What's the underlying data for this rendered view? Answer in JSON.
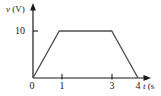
{
  "chart_data": {
    "type": "line",
    "title": "",
    "xlabel": "t (s",
    "ylabel": "v (V)",
    "x": [
      0,
      1,
      3,
      4
    ],
    "values": [
      0,
      10,
      10,
      0
    ],
    "series": [
      {
        "name": "v",
        "x": [
          0,
          1,
          3,
          4
        ],
        "values": [
          0,
          10,
          10,
          0
        ]
      }
    ],
    "xlim": [
      0,
      4
    ],
    "ylim": [
      0,
      10
    ],
    "xticks": [
      "0",
      "1",
      "3",
      "4"
    ],
    "xtick_values": [
      0,
      1,
      3,
      4
    ],
    "yticks": [
      "10"
    ],
    "ytick_values": [
      10
    ],
    "grid": false,
    "legend": false,
    "line_color": "#4d4d4d",
    "axis_color": "#1a1a1a"
  },
  "axes": {
    "y_label_var": "v",
    "y_label_unit": "(V)",
    "x_label_var": "t",
    "x_label_unit": "(s"
  },
  "ticks": {
    "y": [
      {
        "label": "10"
      }
    ],
    "x": [
      {
        "label": "0"
      },
      {
        "label": "1"
      },
      {
        "label": "3"
      },
      {
        "label": "4"
      }
    ]
  }
}
